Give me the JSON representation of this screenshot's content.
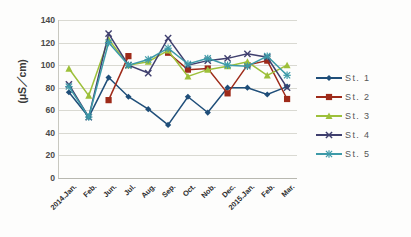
{
  "chart_data": {
    "type": "line",
    "title": "",
    "xlabel": "",
    "ylabel": "(μS／cm)",
    "ylim": [
      0,
      140
    ],
    "ytick_step": 20,
    "yticks": [
      140,
      120,
      100,
      80,
      60,
      40,
      20,
      0
    ],
    "grid": true,
    "legend_position": "right",
    "categories": [
      "2014.Jan.",
      "Feb.",
      "Jun.",
      "Jul.",
      "Aug.",
      "Sep.",
      "Oct.",
      "Nob.",
      "Dec.",
      "2015.Jan.",
      "Feb.",
      "Mar."
    ],
    "series": [
      {
        "name": "St. 1",
        "color": "#1f4e79",
        "marker": "diamond",
        "values": [
          76,
          54,
          89,
          72,
          61,
          47,
          72,
          58,
          80,
          80,
          74,
          81
        ]
      },
      {
        "name": "St. 2",
        "color": "#9e2a19",
        "marker": "square",
        "values": [
          null,
          null,
          69,
          108,
          null,
          111,
          96,
          97,
          75,
          100,
          104,
          70
        ]
      },
      {
        "name": "St. 3",
        "color": "#9dc03a",
        "marker": "triangle",
        "values": [
          97,
          73,
          123,
          100,
          103,
          113,
          90,
          96,
          99,
          103,
          91,
          100
        ]
      },
      {
        "name": "St. 4",
        "color": "#3f3f6e",
        "marker": "cross",
        "values": [
          83,
          54,
          128,
          100,
          93,
          124,
          100,
          104,
          106,
          110,
          107,
          80
        ]
      },
      {
        "name": "St. 5",
        "color": "#3d9aa8",
        "marker": "asterisk",
        "values": [
          81,
          54,
          120,
          100,
          105,
          115,
          101,
          106,
          100,
          99,
          108,
          91
        ]
      }
    ]
  },
  "legend": {
    "items": [
      {
        "label": "St. 1"
      },
      {
        "label": "St. 2"
      },
      {
        "label": "St. 3"
      },
      {
        "label": "St. 4"
      },
      {
        "label": "St. 5"
      }
    ]
  }
}
